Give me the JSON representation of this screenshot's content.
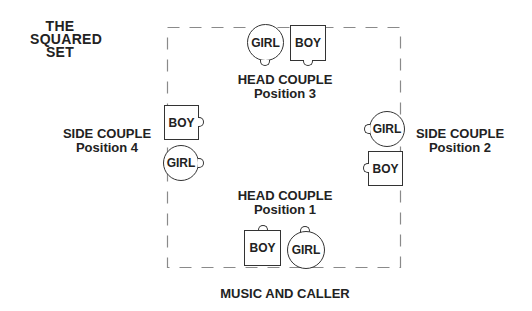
{
  "title": {
    "line1": "THE",
    "line2": "SQUARED",
    "line3": "SET"
  },
  "positions": {
    "p3": {
      "heading": "HEAD COUPLE",
      "position": "Position 3",
      "girl": "GIRL",
      "boy": "BOY"
    },
    "p4": {
      "heading": "SIDE COUPLE",
      "position": "Position 4",
      "girl": "GIRL",
      "boy": "BOY"
    },
    "p2": {
      "heading": "SIDE COUPLE",
      "position": "Position 2",
      "girl": "GIRL",
      "boy": "BOY"
    },
    "p1": {
      "heading": "HEAD COUPLE",
      "position": "Position 1",
      "girl": "GIRL",
      "boy": "BOY"
    }
  },
  "footer": {
    "label": "MUSIC AND CALLER"
  },
  "colors": {
    "stroke": "#333333",
    "text": "#222222",
    "background": "#ffffff",
    "frame": "#888888"
  }
}
